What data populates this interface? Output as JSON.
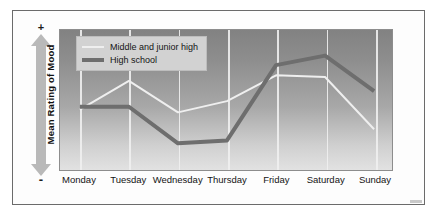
{
  "figure": {
    "y_axis": {
      "label": "Mean Rating of Mood",
      "positive_sign": "+",
      "negative_sign": "-",
      "arrow_icon": "double-headed-vertical-arrow-icon"
    },
    "legend": {
      "entries": [
        {
          "label": "Middle and junior high",
          "color": "#efefef",
          "style": "thin"
        },
        {
          "label": "High school",
          "color": "#6e6e6e",
          "style": "thick"
        }
      ]
    }
  },
  "chart_data": {
    "type": "line",
    "title": "",
    "xlabel": "",
    "ylabel": "Mean Rating of Mood",
    "categories": [
      "Monday",
      "Tuesday",
      "Wednesday",
      "Thursday",
      "Friday",
      "Saturday",
      "Sunday"
    ],
    "ylim": [
      -1,
      1
    ],
    "yticks": [
      "-",
      "+"
    ],
    "grid": "vertical-only",
    "legend_position": "top-left",
    "series": [
      {
        "name": "Middle and junior high",
        "color": "#efefef",
        "values": [
          -0.17,
          0.34,
          -0.22,
          -0.02,
          0.44,
          0.41,
          -0.52
        ]
      },
      {
        "name": "High school",
        "color": "#6e6e6e",
        "values": [
          -0.12,
          -0.12,
          -0.77,
          -0.72,
          0.62,
          0.79,
          0.16
        ]
      }
    ]
  }
}
